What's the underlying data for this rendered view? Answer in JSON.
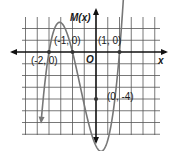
{
  "chart_data": {
    "type": "line",
    "title": "",
    "xlabel": "x",
    "ylabel": "M(x)",
    "origin_label": "O",
    "function": "M(x) = 2(x + 2)(x + 1)(x - 1)",
    "grid": true,
    "grid_units_per_cell": 0.5,
    "xlim": [
      -3,
      2.5
    ],
    "ylim": [
      -3.5,
      1.5
    ],
    "ylim_visible": [
      -7,
      3
    ],
    "points": [
      {
        "x": -2,
        "y": 0,
        "label": "(-2, 0)"
      },
      {
        "x": -1,
        "y": 0,
        "label": "(-1, 0)"
      },
      {
        "x": 1,
        "y": 0,
        "label": "(1, 0)"
      },
      {
        "x": 0,
        "y": -4,
        "label": "(0, -4)"
      }
    ],
    "series": [
      {
        "name": "M(x)",
        "x": [
          -2.35,
          -2,
          -1.5,
          -1,
          -0.5,
          0,
          0.5,
          1,
          1.3
        ],
        "y": [
          3.0,
          0,
          0.75,
          0,
          -2.25,
          -4,
          -3.75,
          0,
          3.5
        ]
      }
    ]
  },
  "labels": {
    "ylabel": "M(x)",
    "xlabel": "x",
    "origin": "O",
    "p1": "(-2, 0)",
    "p2": "(-1, 0)",
    "p3": "(1, 0)",
    "p4": "(0, -4)"
  }
}
